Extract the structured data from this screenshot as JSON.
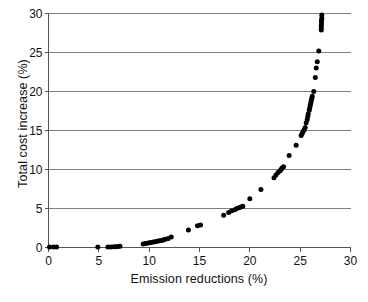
{
  "chart_data": {
    "type": "scatter",
    "title": "",
    "xlabel": "Emission reductions (%)",
    "ylabel": "Total cost increase (%)",
    "xlim": [
      0,
      30
    ],
    "ylim": [
      0,
      30
    ],
    "xticks": [
      0,
      5,
      10,
      15,
      20,
      25,
      30
    ],
    "yticks": [
      0,
      5,
      10,
      15,
      20,
      25,
      30
    ],
    "xtick_labels": [
      "0",
      "5",
      "10",
      "15",
      "20",
      "25",
      "30"
    ],
    "ytick_labels": [
      "0",
      "5",
      "10",
      "15",
      "20",
      "25",
      "30"
    ],
    "grid": "horizontal",
    "grid_color": "#808080",
    "legend": "none",
    "marker": {
      "shape": "circle",
      "color": "#000000",
      "size_px": 5
    },
    "axis_color": "#555555",
    "series": [
      {
        "name": "Abatement cost curve",
        "color": "#000000",
        "points": [
          [
            0.1,
            0.05
          ],
          [
            0.5,
            0.05
          ],
          [
            0.8,
            0.05
          ],
          [
            4.9,
            0.05
          ],
          [
            5.9,
            0.05
          ],
          [
            6.2,
            0.08
          ],
          [
            6.5,
            0.1
          ],
          [
            6.7,
            0.1
          ],
          [
            6.9,
            0.12
          ],
          [
            7.1,
            0.15
          ],
          [
            9.4,
            0.45
          ],
          [
            9.6,
            0.5
          ],
          [
            9.8,
            0.55
          ],
          [
            10.0,
            0.6
          ],
          [
            10.2,
            0.65
          ],
          [
            10.4,
            0.7
          ],
          [
            10.6,
            0.75
          ],
          [
            10.8,
            0.8
          ],
          [
            11.0,
            0.85
          ],
          [
            11.2,
            0.9
          ],
          [
            11.4,
            0.95
          ],
          [
            11.6,
            1.05
          ],
          [
            11.9,
            1.15
          ],
          [
            12.2,
            1.35
          ],
          [
            13.9,
            2.25
          ],
          [
            14.8,
            2.8
          ],
          [
            15.1,
            2.9
          ],
          [
            17.4,
            4.15
          ],
          [
            17.9,
            4.5
          ],
          [
            18.2,
            4.7
          ],
          [
            18.5,
            4.85
          ],
          [
            18.7,
            5.0
          ],
          [
            18.9,
            5.1
          ],
          [
            19.1,
            5.2
          ],
          [
            19.3,
            5.3
          ],
          [
            20.0,
            6.25
          ],
          [
            21.1,
            7.45
          ],
          [
            22.4,
            8.95
          ],
          [
            22.6,
            9.3
          ],
          [
            22.8,
            9.6
          ],
          [
            23.0,
            9.85
          ],
          [
            23.1,
            10.0
          ],
          [
            23.2,
            10.2
          ],
          [
            23.35,
            10.35
          ],
          [
            23.9,
            11.8
          ],
          [
            24.6,
            13.1
          ],
          [
            25.1,
            14.35
          ],
          [
            25.2,
            14.6
          ],
          [
            25.3,
            14.9
          ],
          [
            25.4,
            15.1
          ],
          [
            25.5,
            15.4
          ],
          [
            25.6,
            16.0
          ],
          [
            25.7,
            16.4
          ],
          [
            25.75,
            16.8
          ],
          [
            25.8,
            17.1
          ],
          [
            25.9,
            17.6
          ],
          [
            25.95,
            17.9
          ],
          [
            26.0,
            18.2
          ],
          [
            26.05,
            18.5
          ],
          [
            26.1,
            18.8
          ],
          [
            26.15,
            19.1
          ],
          [
            26.2,
            19.4
          ],
          [
            26.35,
            20.0
          ],
          [
            26.5,
            21.8
          ],
          [
            26.6,
            23.0
          ],
          [
            26.7,
            23.8
          ],
          [
            26.85,
            25.2
          ],
          [
            27.1,
            27.9
          ],
          [
            27.1,
            28.2
          ],
          [
            27.1,
            28.5
          ],
          [
            27.12,
            28.8
          ],
          [
            27.12,
            29.1
          ],
          [
            27.15,
            29.4
          ],
          [
            27.15,
            29.8
          ]
        ]
      }
    ]
  }
}
